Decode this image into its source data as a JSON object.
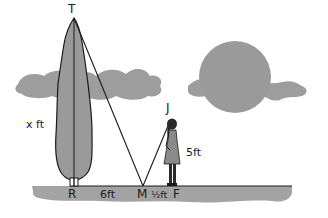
{
  "diagram": {
    "type": "similar-triangles-mirror-problem",
    "points": {
      "T": "T",
      "R": "R",
      "M": "M",
      "F": "F",
      "J": "J"
    },
    "measurements": {
      "tree_height": "x ft",
      "tree_to_mirror": "6ft",
      "mirror_to_girl": "½ft",
      "girl_height": "5ft"
    },
    "objects": [
      "tree",
      "girl",
      "sun",
      "clouds",
      "ground"
    ],
    "colors": {
      "fill_gray": "#9a9a9a",
      "ground_gray": "#a3a3a3",
      "line": "#1a1a1a",
      "background": "#ffffff"
    }
  }
}
